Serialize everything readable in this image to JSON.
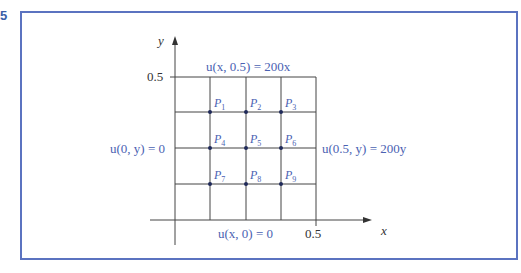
{
  "figure": {
    "number_label": "5"
  },
  "diagram": {
    "axes": {
      "x_label": "x",
      "y_label": "y",
      "x_tick": "0.5",
      "y_tick": "0.5"
    },
    "boundary_conditions": {
      "top": "u(x, 0.5) = 200x",
      "left": "u(0, y) = 0",
      "right": "u(0.5, y) = 200y",
      "bottom": "u(x, 0) = 0"
    },
    "points": [
      {
        "label": "P",
        "sub": "1"
      },
      {
        "label": "P",
        "sub": "2"
      },
      {
        "label": "P",
        "sub": "3"
      },
      {
        "label": "P",
        "sub": "4"
      },
      {
        "label": "P",
        "sub": "5"
      },
      {
        "label": "P",
        "sub": "6"
      },
      {
        "label": "P",
        "sub": "7"
      },
      {
        "label": "P",
        "sub": "8"
      },
      {
        "label": "P",
        "sub": "9"
      }
    ],
    "colors": {
      "frame": "#5b73c0",
      "label_blue": "#4a62b2",
      "grid": "#444444"
    }
  }
}
